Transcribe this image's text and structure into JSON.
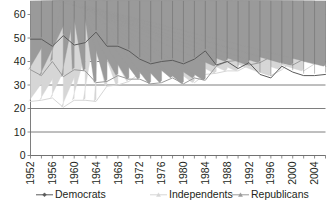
{
  "chart_data": {
    "type": "line",
    "title": "",
    "subtitle": "",
    "xlabel": "",
    "ylabel": "",
    "xlim": [
      1952,
      2006
    ],
    "ylim": [
      0,
      60
    ],
    "ytick_step": 10,
    "yticks": [
      0,
      10,
      20,
      30,
      40,
      50,
      60
    ],
    "ytick_labels": [
      "0",
      "10",
      "20",
      "30",
      "40",
      "50",
      "60"
    ],
    "grid": true,
    "grid_axis": "y",
    "legend_position": "bottom",
    "x": [
      1952,
      1954,
      1956,
      1958,
      1960,
      1962,
      1964,
      1966,
      1968,
      1970,
      1972,
      1974,
      1976,
      1978,
      1980,
      1982,
      1984,
      1986,
      1988,
      1990,
      1992,
      1994,
      1996,
      1998,
      2000,
      2002,
      2004,
      2006
    ],
    "xtick_labels": [
      "1952",
      "1956",
      "1960",
      "1964",
      "1968",
      "1972",
      "1976",
      "1980",
      "1984",
      "1988",
      "1992",
      "1996",
      "2000",
      "2004"
    ],
    "xtick_values": [
      1952,
      1956,
      1960,
      1964,
      1968,
      1972,
      1976,
      1980,
      1984,
      1988,
      1992,
      1996,
      2000,
      2004
    ],
    "minor_tick_values": [
      1952,
      1954,
      1956,
      1958,
      1960,
      1962,
      1964,
      1966,
      1968,
      1970,
      1972,
      1974,
      1976,
      1978,
      1980,
      1982,
      1984,
      1986,
      1988,
      1990,
      1992,
      1994,
      1996,
      1998,
      2000,
      2002,
      2004,
      2006
    ],
    "series": [
      {
        "name": "Democrats",
        "color": "#5b5b5b",
        "marker": "diamond",
        "values": [
          49.5,
          49.5,
          46.5,
          51,
          47,
          48,
          52.5,
          46.5,
          46.5,
          44.5,
          41,
          39,
          40,
          40.5,
          39,
          41,
          44.5,
          38.5,
          40,
          37,
          39.5,
          34.5,
          33,
          38,
          35.5,
          34,
          34,
          34.5
        ]
      },
      {
        "name": "Independents",
        "color": "#d6d6d6",
        "marker": "triangle",
        "values": [
          23,
          23.5,
          24.5,
          20.5,
          23.5,
          23.5,
          23,
          29.5,
          30,
          31.5,
          35,
          35.5,
          36.5,
          38,
          35.5,
          31,
          34.5,
          35,
          36,
          36,
          38.5,
          35.5,
          34,
          36.5,
          40.5,
          36,
          39,
          39.5
        ]
      },
      {
        "name": "Republicans",
        "color": "#9a9a9a",
        "marker": "triangle",
        "values": [
          36.5,
          34,
          40,
          33.5,
          36.5,
          36,
          31,
          31.5,
          34,
          32.5,
          32.5,
          30.5,
          31,
          33,
          30.5,
          33,
          32,
          38,
          40,
          40.5,
          38.5,
          39.5,
          42,
          39.5,
          38.5,
          41,
          44,
          38
        ]
      }
    ]
  },
  "legend": {
    "entries": [
      {
        "label": "Democrats"
      },
      {
        "label": "Independents"
      },
      {
        "label": "Republicans"
      }
    ]
  },
  "colors": {
    "democrats": "#5b5b5b",
    "independents": "#d6d6d6",
    "republicans": "#9a9a9a",
    "axis": "#6f6f6f",
    "text": "#231f20",
    "background": "#ffffff"
  }
}
